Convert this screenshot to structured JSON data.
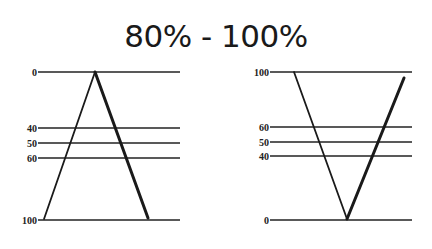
{
  "title": "80% - 100%",
  "colors": {
    "line": "#222222",
    "text": "#1a1a1a",
    "background": "#ffffff"
  },
  "left_diagram": {
    "levels": [
      {
        "label": "0",
        "y": 72
      },
      {
        "label": "40",
        "y": 128
      },
      {
        "label": "50",
        "y": 143
      },
      {
        "label": "60",
        "y": 158
      },
      {
        "label": "100",
        "y": 220
      }
    ],
    "shape": "A (apex at top, level 0)",
    "legs": [
      {
        "name": "thin-leg",
        "x1": 44,
        "y1": 219,
        "x2": 95,
        "y2": 72,
        "width": 1.8
      },
      {
        "name": "thick-leg",
        "x1": 95,
        "y1": 72,
        "x2": 148,
        "y2": 218,
        "width": 3
      }
    ]
  },
  "right_diagram": {
    "levels": [
      {
        "label": "100",
        "y": 72
      },
      {
        "label": "60",
        "y": 127
      },
      {
        "label": "50",
        "y": 142
      },
      {
        "label": "40",
        "y": 156
      },
      {
        "label": "0",
        "y": 220
      }
    ],
    "shape": "V (vertex at bottom, level 0)",
    "legs": [
      {
        "name": "thin-leg",
        "x1": 294,
        "y1": 72,
        "x2": 347,
        "y2": 219,
        "width": 1.8
      },
      {
        "name": "thick-leg",
        "x1": 347,
        "y1": 219,
        "x2": 404,
        "y2": 78,
        "width": 3
      }
    ]
  }
}
